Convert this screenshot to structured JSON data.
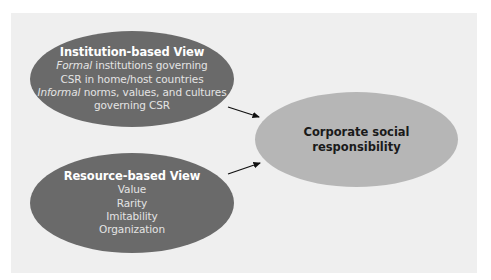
{
  "diagram": {
    "background_color": "#efefef",
    "nodes": {
      "institution_view": {
        "title": "Institution-based View",
        "lines": [
          {
            "emphasis": "Formal",
            "text": " institutions governing"
          },
          {
            "emphasis": "",
            "text": "CSR in home/host countries"
          },
          {
            "emphasis": "Informal",
            "text": " norms, values, and cultures"
          },
          {
            "emphasis": "",
            "text": "governing CSR"
          }
        ],
        "fill": "#6a6a6a"
      },
      "resource_view": {
        "title": "Resource-based View",
        "lines": [
          {
            "text": "Value"
          },
          {
            "text": "Rarity"
          },
          {
            "text": "Imitability"
          },
          {
            "text": "Organization"
          }
        ],
        "fill": "#6a6a6a"
      },
      "csr": {
        "label": "Corporate social responsibility",
        "fill": "#b6b6b6"
      }
    },
    "edges": [
      {
        "from": "institution_view",
        "to": "csr",
        "type": "arrow"
      },
      {
        "from": "resource_view",
        "to": "csr",
        "type": "arrow"
      }
    ],
    "arrow_color": "#111111"
  }
}
